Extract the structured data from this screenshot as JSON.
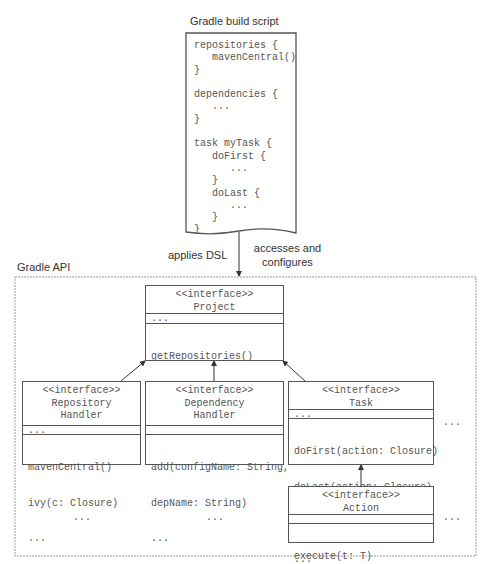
{
  "build_script": {
    "title": "Gradle build script",
    "lines": [
      "repositories {",
      "   mavenCentral()",
      "}",
      "",
      "dependencies {",
      "   ...",
      "}",
      "",
      "task myTask {",
      "   doFirst {",
      "      ...",
      "   }",
      "   doLast {",
      "      ...",
      "   }",
      "}"
    ]
  },
  "edges": {
    "applies_dsl": "applies DSL",
    "accesses_line1": "accesses and",
    "accesses_line2": "configures"
  },
  "api": {
    "title": "Gradle API",
    "project": {
      "stereotype": "<<interface>>",
      "name": "Project",
      "attrs": "...",
      "ops": [
        "getRepositories()",
        "getDependencies()",
        "..."
      ]
    },
    "repository_handler": {
      "stereotype": "<<interface>>",
      "name_line1": "Repository",
      "name_line2": "Handler",
      "attrs": "...",
      "ops": [
        "mavenCentral()",
        "ivy(c: Closure)",
        "..."
      ]
    },
    "dependency_handler": {
      "stereotype": "<<interface>>",
      "name_line1": "Dependency",
      "name_line2": "Handler",
      "attrs": "",
      "ops": [
        "add(configName: String,",
        "depName: String)",
        "..."
      ]
    },
    "task": {
      "stereotype": "<<interface>>",
      "name": "Task",
      "attrs": "...",
      "ops": [
        "doFirst(action: Closure)",
        "doLast(action: Closure)",
        "getDependsOn()",
        "..."
      ]
    },
    "action": {
      "stereotype": "<<interface>>",
      "name": "Action",
      "attrs": "",
      "ops": [
        "execute(t: T)"
      ]
    },
    "ellipses": {
      "right_of_task": "...",
      "bottom_left": "...",
      "bottom_middle": "...",
      "right_of_action": "..."
    }
  }
}
